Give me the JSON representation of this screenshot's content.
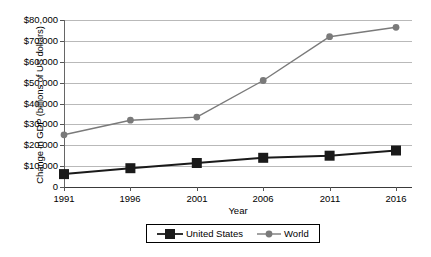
{
  "chart_data": {
    "type": "line",
    "title": "",
    "xlabel": "Year",
    "ylabel": "Change in GDP (billions of US dollars)",
    "categories": [
      "1991",
      "1996",
      "2001",
      "2006",
      "2011",
      "2016"
    ],
    "x_tick_labels": [
      "1991",
      "1996",
      "2001",
      "2006",
      "2011",
      "2016"
    ],
    "y_tick_labels": [
      "0",
      "$10,000",
      "$20,000",
      "$30,000",
      "$40,000",
      "$50,000",
      "$60,000",
      "$70,000",
      "$80,000"
    ],
    "y_tick_values": [
      0,
      10000,
      20000,
      30000,
      40000,
      50000,
      60000,
      70000,
      80000
    ],
    "ylim": [
      0,
      80000
    ],
    "grid": "horizontal",
    "legend_position": "bottom",
    "series": [
      {
        "name": "United States",
        "marker": "square",
        "color": "#1a1a1a",
        "values": [
          6200,
          9000,
          11500,
          14000,
          15000,
          17500
        ]
      },
      {
        "name": "World",
        "marker": "circle",
        "color": "#7a7a7a",
        "values": [
          25000,
          32000,
          33500,
          51000,
          72000,
          76500
        ]
      }
    ]
  },
  "legend": {
    "entries": [
      {
        "label": "United States"
      },
      {
        "label": "World"
      }
    ]
  },
  "colors": {
    "united_states": "#1a1a1a",
    "world": "#7a7a7a",
    "gridline": "#b9b9b9",
    "axis": "#555555"
  }
}
